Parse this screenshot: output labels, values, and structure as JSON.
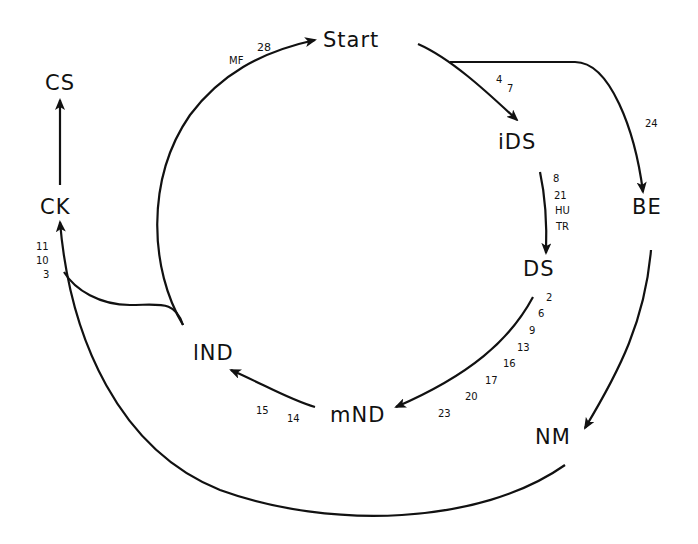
{
  "nodes": {
    "start": "Start",
    "ids": "iDS",
    "ds": "DS",
    "be": "BE",
    "nm": "NM",
    "mnd": "mND",
    "lnd": "lND",
    "ck": "CK",
    "cs": "CS"
  },
  "edge_labels": {
    "lnd_to_start": [
      "MF",
      "28"
    ],
    "start_to_ids": [
      "4",
      "7"
    ],
    "start_to_be": [
      "24"
    ],
    "ids_to_ds": [
      "8",
      "21",
      "HU",
      "TR"
    ],
    "ds_to_mnd": [
      "2",
      "6",
      "9",
      "13",
      "16",
      "17",
      "20",
      "23"
    ],
    "mnd_to_lnd": [
      "15",
      "14"
    ],
    "to_ck": [
      "11",
      "10",
      "3"
    ]
  },
  "colors": {
    "line": "#111111",
    "background": "#ffffff"
  }
}
